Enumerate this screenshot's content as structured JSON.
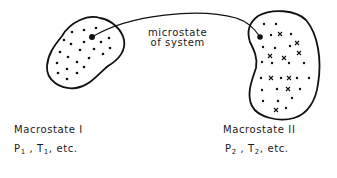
{
  "caption": {
    "microstate_line1": "microstate",
    "microstate_line2": "of system"
  },
  "macrostates": [
    {
      "title": "Macrostate I",
      "p_symbol": "P",
      "p_sub": "1",
      "t_symbol": "T",
      "t_sub": "1",
      "etc": "etc."
    },
    {
      "title": "Macrostate II",
      "p_symbol": "P",
      "p_sub": "2",
      "t_symbol": "T",
      "t_sub": "2",
      "etc": "etc."
    }
  ],
  "colors": {
    "ink": "#111111",
    "background": "#ffffff"
  }
}
